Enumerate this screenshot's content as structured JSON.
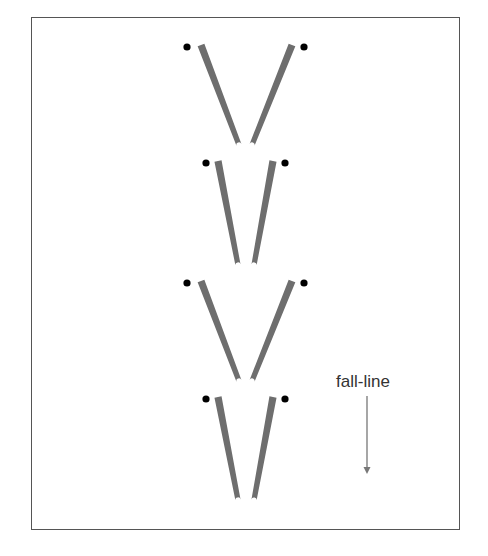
{
  "diagram": {
    "title": "",
    "label": "fall-line",
    "colors": {
      "ski": "#6e6e6e",
      "pole_dot": "#000000",
      "frame": "#555555",
      "arrow": "#777777"
    },
    "ski_pairs": [
      {
        "id": "pair-1",
        "stance": "wide",
        "left_ski": {
          "x1": 201,
          "y1": 45,
          "x2": 239,
          "y2": 145
        },
        "right_ski": {
          "x1": 292,
          "y1": 45,
          "x2": 252,
          "y2": 145
        },
        "pole_dots": [
          {
            "x": 187,
            "y": 47
          },
          {
            "x": 304,
            "y": 47
          }
        ]
      },
      {
        "id": "pair-2",
        "stance": "narrow",
        "left_ski": {
          "x1": 218,
          "y1": 161,
          "x2": 238,
          "y2": 265
        },
        "right_ski": {
          "x1": 273,
          "y1": 161,
          "x2": 254,
          "y2": 265
        },
        "pole_dots": [
          {
            "x": 206,
            "y": 163
          },
          {
            "x": 285,
            "y": 163
          }
        ]
      },
      {
        "id": "pair-3",
        "stance": "wide",
        "left_ski": {
          "x1": 201,
          "y1": 281,
          "x2": 239,
          "y2": 381
        },
        "right_ski": {
          "x1": 292,
          "y1": 281,
          "x2": 252,
          "y2": 381
        },
        "pole_dots": [
          {
            "x": 187,
            "y": 283
          },
          {
            "x": 304,
            "y": 283
          }
        ]
      },
      {
        "id": "pair-4",
        "stance": "narrow",
        "left_ski": {
          "x1": 218,
          "y1": 397,
          "x2": 238,
          "y2": 500
        },
        "right_ski": {
          "x1": 273,
          "y1": 397,
          "x2": 254,
          "y2": 500
        },
        "pole_dots": [
          {
            "x": 206,
            "y": 399
          },
          {
            "x": 285,
            "y": 399
          }
        ]
      }
    ],
    "arrow": {
      "x": 367,
      "y1": 396,
      "y2": 474,
      "direction": "down"
    }
  }
}
